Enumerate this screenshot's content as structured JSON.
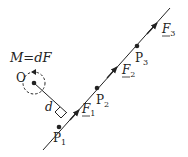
{
  "diagram": {
    "moment_equation": {
      "M": "M",
      "eq": "=",
      "d": "d",
      "F": "F"
    },
    "point_O": "O",
    "distance_label": "d",
    "points": [
      {
        "name": "P",
        "sub": "1"
      },
      {
        "name": "P",
        "sub": "2"
      },
      {
        "name": "P",
        "sub": "3"
      }
    ],
    "forces": [
      {
        "name": "F",
        "sub": "1"
      },
      {
        "name": "F",
        "sub": "2"
      },
      {
        "name": "F",
        "sub": "3"
      }
    ],
    "colors": {
      "line": "#222222",
      "background": "#ffffff"
    }
  }
}
